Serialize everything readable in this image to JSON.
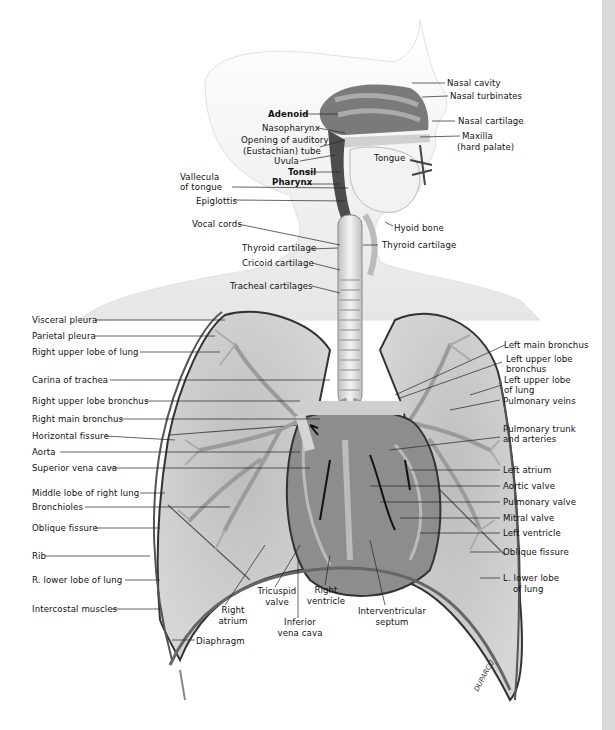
{
  "figure": {
    "signature": "DUPARCQ",
    "colors": {
      "background": "#ffffff",
      "side_strip": "#d9d9d9",
      "skin": "#f2f2f2",
      "lung": "#c9c9c9",
      "airway_dark": "#555555",
      "heart": "#8c8c8c",
      "line": "#111111"
    }
  },
  "labels": {
    "head": {
      "nasal_cavity": "Nasal cavity",
      "nasal_turbinates": "Nasal turbinates",
      "nasal_cartilage": "Nasal cartilage",
      "maxilla": "Maxilla",
      "hard_palate": "(hard palate)",
      "adenoid": "Adenoid",
      "nasopharynx": "Nasopharynx",
      "auditory_1": "Opening of auditory",
      "auditory_2": "(Eustachian) tube",
      "uvula": "Uvula",
      "tonsil": "Tonsil",
      "pharynx": "Pharynx",
      "tongue": "Tongue",
      "vallecula_1": "Vallecula",
      "vallecula_2": "of tongue",
      "epiglottis": "Epiglottis"
    },
    "neck": {
      "vocal_cords": "Vocal cords",
      "hyoid_bone": "Hyoid bone",
      "thyroid_cartilage_left": "Thyroid cartilage",
      "thyroid_cartilage_right": "Thyroid cartilage",
      "cricoid_cartilage": "Cricoid cartilage",
      "tracheal_cartilages": "Tracheal cartilages"
    },
    "left_column": [
      "Visceral pleura",
      "Parietal pleura",
      "Right upper lobe of lung",
      "Carina of trachea",
      "Right upper lobe bronchus",
      "Right main bronchus",
      "Horizontal fissure",
      "Aorta",
      "Superior vena cava",
      "Middle lobe of right lung",
      "Bronchioles",
      "Oblique fissure",
      "Rib",
      "R. lower lobe of lung",
      "Intercostal muscles"
    ],
    "right_column": {
      "left_main_bronchus": "Left main bronchus",
      "left_upper_lobe_bronchus_1": "Left upper lobe",
      "left_upper_lobe_bronchus_2": "bronchus",
      "left_upper_lobe_lung_1": "Left upper lobe",
      "left_upper_lobe_lung_2": "of lung",
      "pulmonary_veins": "Pulmonary veins",
      "pulmonary_trunk_1": "Pulmonary trunk",
      "pulmonary_trunk_2": "and arteries",
      "left_atrium": "Left atrium",
      "aortic_valve": "Aortic valve",
      "pulmonary_valve": "Pulmonary valve",
      "mitral_valve": "Mitral valve",
      "left_ventricle": "Left ventricle",
      "oblique_fissure": "Oblique fissure",
      "l_lower_lobe_1": "L. lower lobe",
      "l_lower_lobe_2": "of lung"
    },
    "bottom": {
      "right_atrium_1": "Right",
      "right_atrium_2": "atrium",
      "tricuspid_1": "Tricuspid",
      "tricuspid_2": "valve",
      "ivc_1": "Inferior",
      "ivc_2": "vena cava",
      "right_ventricle_1": "Right",
      "right_ventricle_2": "ventricle",
      "interventricular_1": "Interventricular",
      "interventricular_2": "septum",
      "diaphragm": "Diaphragm"
    }
  }
}
